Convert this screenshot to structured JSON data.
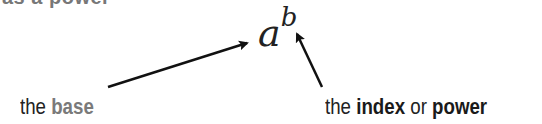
{
  "header": {
    "cut_text": "as a power"
  },
  "expression": {
    "base": "a",
    "exponent": "b"
  },
  "labels": {
    "base": {
      "prefix": "the ",
      "term": "base"
    },
    "index": {
      "prefix": "the ",
      "term1": "index",
      "joiner": " or ",
      "term2": "power"
    }
  },
  "colors": {
    "base_term": "#7a7a7a",
    "index_term": "#1a1a1a",
    "text": "#222222",
    "arrow": "#111111"
  }
}
